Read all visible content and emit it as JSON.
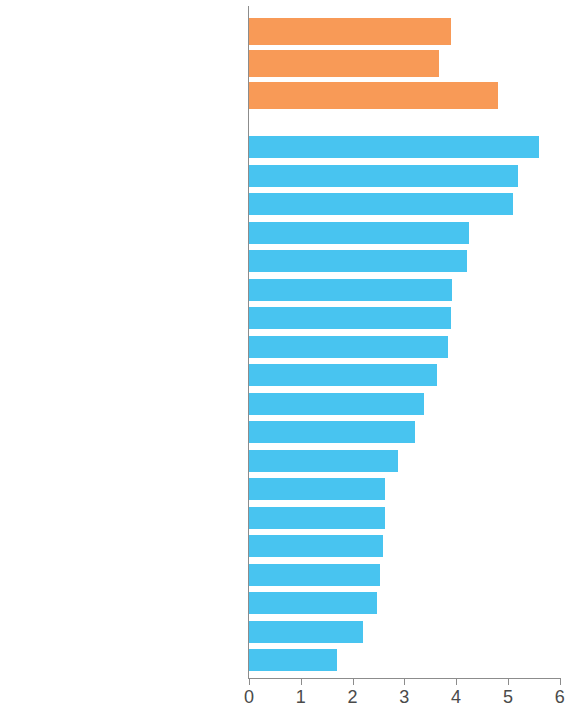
{
  "chart_data": {
    "type": "bar",
    "orientation": "horizontal",
    "title": "",
    "subtitle": "",
    "xlabel": "",
    "ylabel": "",
    "xlim": [
      0,
      6
    ],
    "ylim": null,
    "grid": false,
    "legend": null,
    "x_ticks": [
      0,
      1,
      2,
      3,
      4,
      5,
      6
    ],
    "x_tick_labels": [
      "0",
      "1",
      "2",
      "3",
      "4",
      "5",
      "6"
    ],
    "colors": {
      "aggregate_bar": "#f89a57",
      "country_bar": "#48c4f0",
      "axis": "#8c8c8c",
      "text": "#3d3d3d",
      "background": "#ffffff"
    },
    "groups": [
      {
        "name": "aggregates",
        "color": "#f89a57",
        "categories": [
          "ADB DMCs",
          "Other Developing Countries",
          "OECD"
        ],
        "values": [
          3.9,
          3.67,
          4.8
        ]
      },
      {
        "name": "economies",
        "color": "#48c4f0",
        "categories": [
          "Republic of Korea",
          "Malaysia",
          "People's Republic of China",
          "Kazakhstan",
          "India",
          "Georgia",
          "Sri Lanka",
          "Azerbaijan",
          "Indonesia",
          "Tajikistan",
          "Viet Nam",
          "Pakistan",
          "Armenia",
          "Mongolia",
          "Bangladesh",
          "Kyrgyz Republic",
          "Thailand",
          "Philippines",
          "Cambodia"
        ],
        "values": [
          5.6,
          5.2,
          5.1,
          4.25,
          4.2,
          3.92,
          3.9,
          3.85,
          3.63,
          3.38,
          3.2,
          2.87,
          2.62,
          2.62,
          2.58,
          2.52,
          2.47,
          2.2,
          1.7
        ]
      }
    ]
  }
}
